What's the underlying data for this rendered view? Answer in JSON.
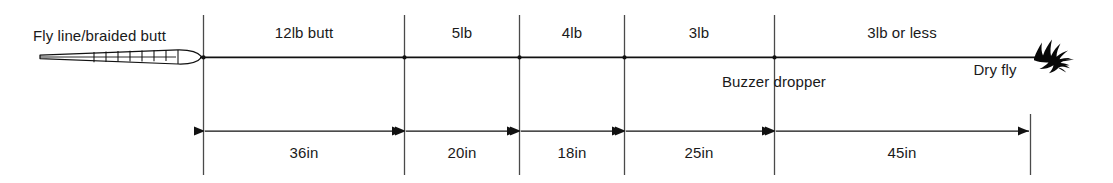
{
  "diagram": {
    "colors": {
      "ink": "#1a1a1a",
      "line": "#2b2b2b",
      "background": "#ffffff"
    },
    "end_labels": {
      "left": "Fly line/braided butt",
      "dropper": "Buzzer dropper",
      "right": "Dry fly"
    },
    "segments": [
      {
        "name": "butt-12lb",
        "label": "12lb butt",
        "length": "36in",
        "x_start": 203,
        "x_end": 404
      },
      {
        "name": "tippet-5lb",
        "label": "5lb",
        "length": "20in",
        "x_start": 404,
        "x_end": 519
      },
      {
        "name": "tippet-4lb",
        "label": "4lb",
        "length": "18in",
        "x_start": 519,
        "x_end": 624
      },
      {
        "name": "tippet-3lb",
        "label": "3lb",
        "length": "25in",
        "x_start": 624,
        "x_end": 774
      },
      {
        "name": "tippet-3lb-or-less",
        "label": "3lb or less",
        "length": "45in",
        "x_start": 774,
        "x_end": 1030
      }
    ],
    "icons": {
      "braided_butt": "braided-butt-icon",
      "dry_fly": "dry-fly-icon"
    },
    "geometry": {
      "main_line_y": 57,
      "dimension_line_y": 131,
      "divider_top_y": 15,
      "divider_bottom_y": 175
    }
  }
}
